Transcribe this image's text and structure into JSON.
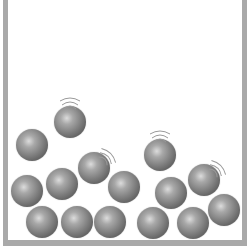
{
  "diagram": {
    "title": "",
    "colors": {
      "wall": "#a9a9a9",
      "ball_highlight": "#dcdcdc",
      "ball_mid": "#7c7c7c",
      "ball_shadow": "#3e3e3e",
      "motion_lines": "#9a9a9a"
    },
    "container": {
      "walls": [
        "left",
        "right",
        "bottom"
      ],
      "open_top": true
    },
    "balls": [
      {
        "id": 1,
        "cx": 70,
        "cy": 122,
        "r": 16,
        "moving": true,
        "motion_dir": "up"
      },
      {
        "id": 2,
        "cx": 32,
        "cy": 145,
        "r": 16,
        "moving": false
      },
      {
        "id": 3,
        "cx": 94,
        "cy": 168,
        "r": 16,
        "moving": true,
        "motion_dir": "up-right"
      },
      {
        "id": 4,
        "cx": 160,
        "cy": 155,
        "r": 16,
        "moving": true,
        "motion_dir": "up"
      },
      {
        "id": 5,
        "cx": 27,
        "cy": 191,
        "r": 16,
        "moving": false
      },
      {
        "id": 6,
        "cx": 62,
        "cy": 184,
        "r": 16,
        "moving": false
      },
      {
        "id": 7,
        "cx": 124,
        "cy": 187,
        "r": 16,
        "moving": false
      },
      {
        "id": 8,
        "cx": 171,
        "cy": 193,
        "r": 16,
        "moving": false
      },
      {
        "id": 9,
        "cx": 204,
        "cy": 180,
        "r": 16,
        "moving": true,
        "motion_dir": "up-right"
      },
      {
        "id": 10,
        "cx": 224,
        "cy": 210,
        "r": 16,
        "moving": false
      },
      {
        "id": 11,
        "cx": 42,
        "cy": 222,
        "r": 16,
        "moving": false
      },
      {
        "id": 12,
        "cx": 77,
        "cy": 222,
        "r": 16,
        "moving": false
      },
      {
        "id": 13,
        "cx": 110,
        "cy": 222,
        "r": 16,
        "moving": false
      },
      {
        "id": 14,
        "cx": 153,
        "cy": 223,
        "r": 16,
        "moving": false
      },
      {
        "id": 15,
        "cx": 193,
        "cy": 223,
        "r": 16,
        "moving": false
      }
    ],
    "ball_count": 15,
    "moving_count": 4
  }
}
